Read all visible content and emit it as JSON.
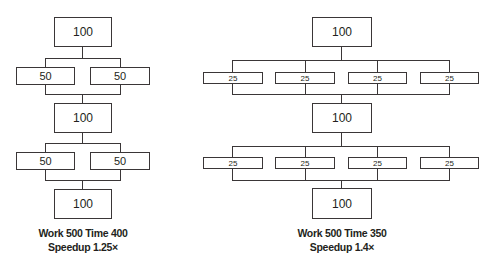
{
  "left": {
    "top": "100",
    "stage1": [
      "50",
      "50"
    ],
    "middle": "100",
    "stage2": [
      "50",
      "50"
    ],
    "bottom": "100",
    "caption_line1": "Work 500 Time 400",
    "caption_line2": "Speedup 1.25×"
  },
  "right": {
    "top": "100",
    "stage1": [
      "25",
      "25",
      "25",
      "25"
    ],
    "middle": "100",
    "stage2": [
      "25",
      "25",
      "25",
      "25"
    ],
    "bottom": "100",
    "caption_line1": "Work 500 Time 350",
    "caption_line2": "Speedup 1.4×"
  }
}
